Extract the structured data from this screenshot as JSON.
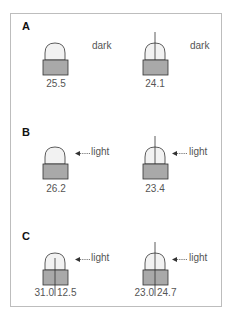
{
  "panels": [
    {
      "label": "A",
      "left": {
        "value": "25.5",
        "tip": false,
        "split": false,
        "stimulus": "dark",
        "arrow": false
      },
      "right": {
        "value": "24.1",
        "tip": true,
        "split": false,
        "stimulus": "dark",
        "arrow": false
      }
    },
    {
      "label": "B",
      "left": {
        "value": "26.2",
        "tip": false,
        "split": false,
        "stimulus": "light",
        "arrow": true
      },
      "right": {
        "value": "23.4",
        "tip": true,
        "split": false,
        "stimulus": "light",
        "arrow": true
      }
    },
    {
      "label": "C",
      "left": {
        "values": [
          "31.0",
          "12.5"
        ],
        "tip": false,
        "split": true,
        "stimulus": "light",
        "arrow": true
      },
      "right": {
        "values": [
          "23.0",
          "24.7"
        ],
        "tip": true,
        "split": true,
        "stimulus": "light",
        "arrow": true
      }
    }
  ],
  "colors": {
    "dome_fill": "#f2f2f2",
    "base_fill": "#a9a9a9",
    "outline": "#333333",
    "frame": "#bdbdbd"
  }
}
